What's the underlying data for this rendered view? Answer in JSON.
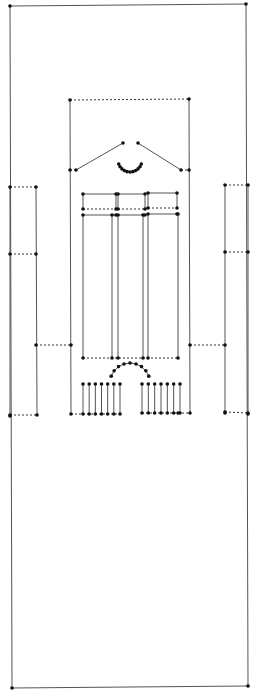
{
  "diagram": {
    "type": "line-drawing",
    "colors": {
      "line": "#555555",
      "node": "#111111",
      "background": "#ffffff"
    },
    "outer_frame": {
      "nodes": [
        [
          10,
          6
        ],
        [
          246,
          4
        ],
        [
          12,
          688
        ],
        [
          248,
          686
        ]
      ]
    },
    "solid_edges": [
      [
        [
          10,
          6
        ],
        [
          246,
          4
        ]
      ],
      [
        [
          10,
          6
        ],
        [
          12,
          688
        ]
      ],
      [
        [
          246,
          4
        ],
        [
          248,
          686
        ]
      ],
      [
        [
          12,
          688
        ],
        [
          248,
          686
        ]
      ],
      [
        [
          70,
          100
        ],
        [
          71,
          414
        ]
      ],
      [
        [
          189,
          99
        ],
        [
          190,
          413
        ]
      ],
      [
        [
          10,
          187
        ],
        [
          10,
          416
        ]
      ],
      [
        [
          36,
          187
        ],
        [
          37,
          415
        ]
      ],
      [
        [
          225,
          185
        ],
        [
          225,
          413
        ]
      ],
      [
        [
          248,
          185
        ],
        [
          248,
          414
        ]
      ],
      [
        [
          76,
          170
        ],
        [
          123,
          143
        ]
      ],
      [
        [
          138,
          143
        ],
        [
          181,
          170
        ]
      ],
      [
        [
          83,
          194
        ],
        [
          116,
          194
        ]
      ],
      [
        [
          83,
          194
        ],
        [
          83,
          209
        ]
      ],
      [
        [
          116,
          194
        ],
        [
          116,
          209
        ]
      ],
      [
        [
          118,
          194
        ],
        [
          145,
          194
        ]
      ],
      [
        [
          118,
          194
        ],
        [
          118,
          209
        ]
      ],
      [
        [
          145,
          194
        ],
        [
          145,
          209
        ]
      ],
      [
        [
          148,
          193
        ],
        [
          177,
          193
        ]
      ],
      [
        [
          148,
          193
        ],
        [
          148,
          208
        ]
      ],
      [
        [
          177,
          193
        ],
        [
          177,
          208
        ]
      ],
      [
        [
          83,
          215
        ],
        [
          116,
          215
        ]
      ],
      [
        [
          118,
          215
        ],
        [
          145,
          215
        ]
      ],
      [
        [
          148,
          214
        ],
        [
          177,
          214
        ]
      ],
      [
        [
          83,
          215
        ],
        [
          83,
          358
        ]
      ],
      [
        [
          112,
          215
        ],
        [
          112,
          358
        ]
      ],
      [
        [
          118,
          215
        ],
        [
          118,
          358
        ]
      ],
      [
        [
          143,
          215
        ],
        [
          143,
          358
        ]
      ],
      [
        [
          148,
          214
        ],
        [
          148,
          358
        ]
      ],
      [
        [
          178,
          214
        ],
        [
          178,
          358
        ]
      ]
    ],
    "dashed_edges": [
      [
        [
          70,
          100
        ],
        [
          189,
          99
        ]
      ],
      [
        [
          70,
          170
        ],
        [
          76,
          170
        ]
      ],
      [
        [
          181,
          170
        ],
        [
          189,
          170
        ]
      ],
      [
        [
          83,
          209
        ],
        [
          116,
          209
        ]
      ],
      [
        [
          118,
          209
        ],
        [
          145,
          209
        ]
      ],
      [
        [
          148,
          208
        ],
        [
          177,
          208
        ]
      ],
      [
        [
          83,
          358
        ],
        [
          178,
          358
        ]
      ],
      [
        [
          10,
          187
        ],
        [
          36,
          187
        ]
      ],
      [
        [
          10,
          254
        ],
        [
          36,
          254
        ]
      ],
      [
        [
          36,
          345
        ],
        [
          71,
          345
        ]
      ],
      [
        [
          10,
          415
        ],
        [
          37,
          415
        ]
      ],
      [
        [
          225,
          185
        ],
        [
          248,
          185
        ]
      ],
      [
        [
          225,
          252
        ],
        [
          248,
          252
        ]
      ],
      [
        [
          190,
          345
        ],
        [
          225,
          345
        ]
      ],
      [
        [
          225,
          412
        ],
        [
          248,
          413
        ]
      ],
      [
        [
          71,
          414
        ],
        [
          83,
          414
        ]
      ],
      [
        [
          178,
          413
        ],
        [
          190,
          413
        ]
      ]
    ],
    "arch_top": {
      "center": [
        130,
        160
      ],
      "radius": 12,
      "from_deg": 200,
      "to_deg": 340,
      "dots": 11
    },
    "arch_bottom": {
      "center": [
        130,
        383
      ],
      "radius": 20,
      "from_deg": 200,
      "to_deg": 340,
      "dots": 9
    },
    "balustrade_left": {
      "x_start": 83,
      "x_end": 120,
      "count": 7,
      "y_top": 384,
      "y_bottom": 414
    },
    "balustrade_right": {
      "x_start": 142,
      "x_end": 180,
      "count": 7,
      "y_top": 384,
      "y_bottom": 413
    }
  }
}
